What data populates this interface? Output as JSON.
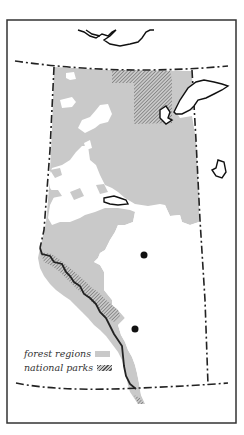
{
  "map": {
    "colors": {
      "forest": "#c9c9c9",
      "park_hatch": "#555555",
      "border": "#222222",
      "frame": "#333333",
      "background": "#ffffff"
    },
    "markers": [
      {
        "name": "city-dot-1",
        "x": 144,
        "y": 255
      },
      {
        "name": "city-dot-2",
        "x": 135,
        "y": 329
      }
    ]
  },
  "legend": {
    "items": [
      {
        "label": "forest regions",
        "pattern": "solid-gray"
      },
      {
        "label": "national parks",
        "pattern": "hatched"
      }
    ]
  }
}
